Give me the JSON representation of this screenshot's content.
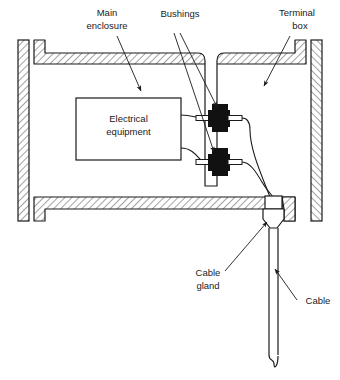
{
  "figure": {
    "type": "cross-section-diagram",
    "background_color": "#ffffff",
    "line_color": "#1a1a1a",
    "hatch_color": "#4d4d4d",
    "fill_dark_color": "#111111"
  },
  "labels": {
    "main_enclosure": {
      "line1": "Main",
      "line2": "enclosure"
    },
    "bushings": {
      "line1": "Bushings"
    },
    "terminal_box": {
      "line1": "Terminal",
      "line2": "box"
    },
    "electrical_equipment": {
      "line1": "Electrical",
      "line2": "equipment"
    },
    "cable_gland": {
      "line1": "Cable",
      "line2": "gland"
    },
    "cable": {
      "line1": "Cable"
    }
  },
  "components": {
    "left_wall": "hatched-vertical-wall",
    "right_wall": "hatched-vertical-wall",
    "top_wall": "hatched-horizontal-wall-with-flange",
    "bottom_wall": "hatched-horizontal-wall-with-flange",
    "divider_wall": "hatched-vertical-partition",
    "equipment_box": "rectangle",
    "bushing_upper": "black-feedthrough-assembly",
    "bushing_lower": "black-feedthrough-assembly",
    "gland_body": "hexagonal-gland",
    "cable_run": "two-line-cable-with-break-symbol"
  }
}
